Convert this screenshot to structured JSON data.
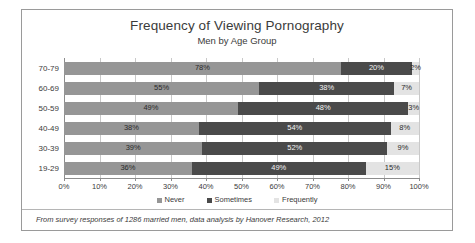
{
  "chart_data": {
    "type": "bar",
    "orientation": "horizontal",
    "stacked": true,
    "title": "Frequency of Viewing Pornography",
    "subtitle": "Men by Age Group",
    "xlabel": "",
    "ylabel": "",
    "xlim": [
      0,
      100
    ],
    "grid": true,
    "legend_position": "bottom",
    "categories": [
      "19-29",
      "30-39",
      "40-49",
      "50-59",
      "60-69",
      "70-79"
    ],
    "display_order_top_to_bottom": [
      "70-79",
      "60-69",
      "50-59",
      "40-49",
      "30-39",
      "19-29"
    ],
    "series": [
      {
        "name": "Never",
        "color": "#969696",
        "values": [
          36,
          39,
          38,
          49,
          55,
          78
        ]
      },
      {
        "name": "Sometimes",
        "color": "#4a4a4a",
        "values": [
          49,
          52,
          54,
          48,
          38,
          20
        ]
      },
      {
        "name": "Frequently",
        "color": "#e3e3e3",
        "values": [
          15,
          9,
          8,
          3,
          7,
          2
        ]
      }
    ],
    "tick_labels": [
      "0%",
      "10%",
      "20%",
      "30%",
      "40%",
      "50%",
      "60%",
      "70%",
      "80%",
      "90%",
      "100%"
    ],
    "tick_values": [
      0,
      10,
      20,
      30,
      40,
      50,
      60,
      70,
      80,
      90,
      100
    ],
    "data_labels": {
      "70-79": [
        "78%",
        "20%",
        "2%"
      ],
      "60-69": [
        "55%",
        "38%",
        "7%"
      ],
      "50-59": [
        "49%",
        "48%",
        "3%"
      ],
      "40-49": [
        "38%",
        "54%",
        "8%"
      ],
      "30-39": [
        "39%",
        "52%",
        "9%"
      ],
      "19-29": [
        "36%",
        "49%",
        "15%"
      ]
    },
    "annotation": "From survey responses of 1286 married men, data analysis by Hanover Research, 2012"
  },
  "legend": {
    "items": [
      {
        "label": "Never"
      },
      {
        "label": "Sometimes"
      },
      {
        "label": "Frequently"
      }
    ]
  },
  "footnote": {
    "text": "From survey responses of 1286 married men, data analysis by Hanover Research, 2012"
  }
}
